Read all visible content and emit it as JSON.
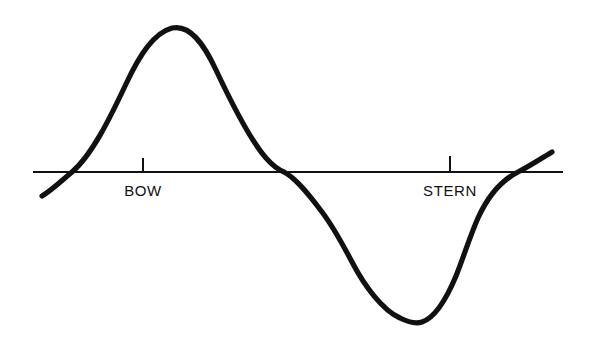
{
  "figure": {
    "background_color": "#ffffff",
    "ink_color": "#111111",
    "width": 593,
    "height": 347
  },
  "axis": {
    "name": "baseline",
    "y": 172,
    "x_start": 33,
    "x_end": 563,
    "stroke_width": 1.8,
    "color": "#111111"
  },
  "ticks": [
    {
      "label": "BOW",
      "x": 143,
      "label_x": 143,
      "label_y": 182,
      "tick_top": 158,
      "tick_bottom": 173
    },
    {
      "label": "STERN",
      "x": 450,
      "label_x": 450,
      "label_y": 182,
      "tick_top": 156,
      "tick_bottom": 173
    }
  ],
  "curve": {
    "name": "wave-profile",
    "stroke_width": 5.2,
    "color": "#111111",
    "path": "M 42,196 C 52,190 60,182 72,172 C 92,155 110,118 126,84 C 140,54 154,33 172,28 C 190,24 204,44 216,70 C 232,104 250,140 266,158 C 274,167 279,170 284,172 C 296,178 310,196 322,212 C 332,225 342,243 352,262 C 364,285 382,310 400,318 C 410,323 416,324 422,322 C 434,318 446,300 456,276 C 464,256 470,236 478,218 C 488,196 502,180 518,172 C 530,166 542,158 552,152"
  },
  "chart_data": {
    "type": "line",
    "title": "",
    "xlabel": "",
    "ylabel": "",
    "grid": false,
    "legend": null,
    "annotations": [
      "BOW",
      "STERN"
    ],
    "x_tick_labels": [
      "BOW",
      "STERN"
    ],
    "x_tick_positions": [
      143,
      450
    ],
    "series": [
      {
        "name": "wave-profile",
        "points": [
          {
            "x": 42,
            "y": 196,
            "note": "curve-start-below-baseline"
          },
          {
            "x": 72,
            "y": 172,
            "note": "zero-crossing-ascending"
          },
          {
            "x": 126,
            "y": 84
          },
          {
            "x": 172,
            "y": 28,
            "note": "crest-peak"
          },
          {
            "x": 216,
            "y": 70
          },
          {
            "x": 266,
            "y": 158
          },
          {
            "x": 284,
            "y": 172,
            "note": "zero-crossing-descending"
          },
          {
            "x": 327,
            "y": 218,
            "note": "shoulder-inflection"
          },
          {
            "x": 372,
            "y": 282
          },
          {
            "x": 422,
            "y": 322,
            "note": "trough-bottom"
          },
          {
            "x": 470,
            "y": 230
          },
          {
            "x": 518,
            "y": 172,
            "note": "zero-crossing-ascending-2"
          },
          {
            "x": 552,
            "y": 152,
            "note": "curve-end-above-baseline"
          }
        ]
      }
    ],
    "baseline_y": 172,
    "xlim": [
      33,
      563
    ],
    "ylim": [
      347,
      0
    ]
  }
}
